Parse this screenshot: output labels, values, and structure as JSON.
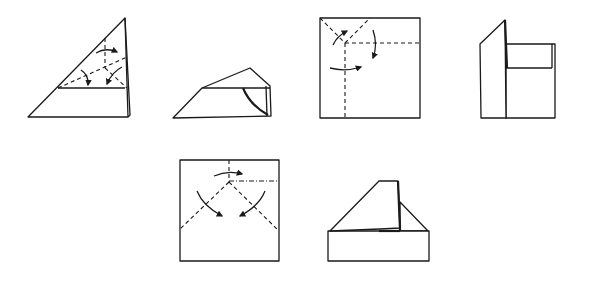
{
  "diagram": {
    "type": "origami folding instructions",
    "background": "#ffffff",
    "line_color": "#1a1a1a",
    "steps": [
      {
        "id": 1,
        "description": "Triangle with valley fold lines and fold arrows"
      },
      {
        "id": 2,
        "description": "Folded flattened triangle shape"
      },
      {
        "id": 3,
        "description": "Square with dashed fold lines and arrows in top-left corner"
      },
      {
        "id": 4,
        "description": "Square with left flap standing up"
      },
      {
        "id": 5,
        "description": "Square with diagonal dashed folds meeting at top center with arrows"
      },
      {
        "id": 6,
        "description": "House-like folded shape with roof"
      }
    ],
    "legend": {
      "dashed_line": "valley fold",
      "dash_dot_line": "mountain fold",
      "curved_arrow": "fold direction"
    }
  }
}
